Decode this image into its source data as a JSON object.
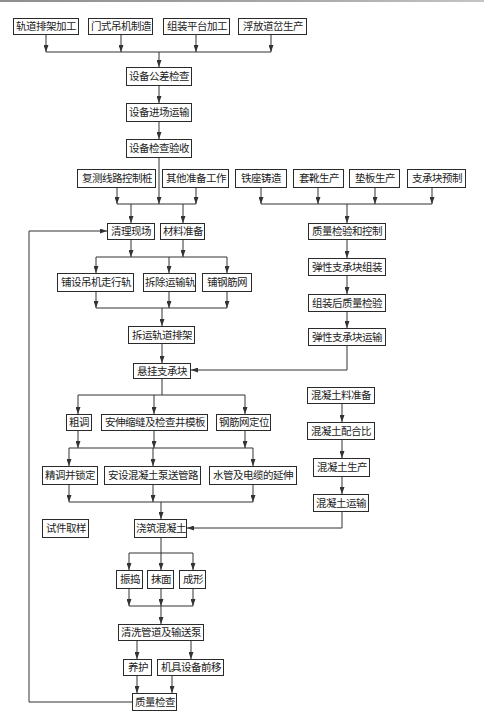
{
  "diagram": {
    "type": "flowchart",
    "nodes": [
      {
        "id": "n0",
        "label": "轨道排架加工"
      },
      {
        "id": "n1",
        "label": "门式吊机制造"
      },
      {
        "id": "n2",
        "label": "组装平台加工"
      },
      {
        "id": "n3",
        "label": "浮放道岔生产"
      },
      {
        "id": "n4",
        "label": "设备公差检查"
      },
      {
        "id": "n5",
        "label": "设备进场运输"
      },
      {
        "id": "n6",
        "label": "设备检查验收"
      },
      {
        "id": "n7",
        "label": "复测线路控制桩"
      },
      {
        "id": "n8",
        "label": "其他准备工作"
      },
      {
        "id": "n9",
        "label": "铁座铸造"
      },
      {
        "id": "n10",
        "label": "套靴生产"
      },
      {
        "id": "n11",
        "label": "垫板生产"
      },
      {
        "id": "n12",
        "label": "支承块预制"
      },
      {
        "id": "n13",
        "label": "清理现场"
      },
      {
        "id": "n14",
        "label": "材料准备"
      },
      {
        "id": "n15",
        "label": "质量检验和控制"
      },
      {
        "id": "n16",
        "label": "铺设吊机走行轨"
      },
      {
        "id": "n17",
        "label": "拆除运输轨"
      },
      {
        "id": "n18",
        "label": "铺钢筋网"
      },
      {
        "id": "n19",
        "label": "弹性支承块组装"
      },
      {
        "id": "n20",
        "label": "组装后质量检验"
      },
      {
        "id": "n21",
        "label": "弹性支承块运输"
      },
      {
        "id": "n22",
        "label": "拆运轨道排架"
      },
      {
        "id": "n23",
        "label": "悬挂支承块"
      },
      {
        "id": "n24",
        "label": "混凝土料准备"
      },
      {
        "id": "n25",
        "label": "粗调"
      },
      {
        "id": "n26",
        "label": "安伸缩缝及检查井模板"
      },
      {
        "id": "n27",
        "label": "钢筋网定位"
      },
      {
        "id": "n28",
        "label": "混凝土配合比"
      },
      {
        "id": "n29",
        "label": "混凝土生产"
      },
      {
        "id": "n30",
        "label": "精调并锁定"
      },
      {
        "id": "n31",
        "label": "安设混凝土泵送管路"
      },
      {
        "id": "n32",
        "label": "水管及电缆的延伸"
      },
      {
        "id": "n33",
        "label": "混凝土运输"
      },
      {
        "id": "n34",
        "label": "试件取样"
      },
      {
        "id": "n35",
        "label": "浇筑混凝土"
      },
      {
        "id": "n36",
        "label": "振捣"
      },
      {
        "id": "n37",
        "label": "抹面"
      },
      {
        "id": "n38",
        "label": "成形"
      },
      {
        "id": "n39",
        "label": "清洗管道及输送泵"
      },
      {
        "id": "n40",
        "label": "养护"
      },
      {
        "id": "n41",
        "label": "机具设备前移"
      },
      {
        "id": "n42",
        "label": "质量检查"
      }
    ],
    "edges": [
      {
        "from": [
          "n0",
          "n1",
          "n2",
          "n3"
        ],
        "to": [
          "n4"
        ]
      },
      {
        "from": [
          "n4"
        ],
        "to": [
          "n5"
        ]
      },
      {
        "from": [
          "n5"
        ],
        "to": [
          "n6"
        ]
      },
      {
        "from": [
          "n6",
          "n7",
          "n8"
        ],
        "to": [
          "n13",
          "n14"
        ]
      },
      {
        "from": [
          "n9",
          "n10",
          "n11",
          "n12"
        ],
        "to": [
          "n15"
        ]
      },
      {
        "from": [
          "n15"
        ],
        "to": [
          "n19"
        ]
      },
      {
        "from": [
          "n19"
        ],
        "to": [
          "n20"
        ]
      },
      {
        "from": [
          "n20"
        ],
        "to": [
          "n21"
        ]
      },
      {
        "from": [
          "n21"
        ],
        "to": [
          "n23"
        ]
      },
      {
        "from": [
          "n13",
          "n14"
        ],
        "to": [
          "n16",
          "n17",
          "n18"
        ]
      },
      {
        "from": [
          "n16",
          "n17",
          "n18"
        ],
        "to": [
          "n22"
        ]
      },
      {
        "from": [
          "n22"
        ],
        "to": [
          "n23"
        ]
      },
      {
        "from": [
          "n23"
        ],
        "to": [
          "n25",
          "n26",
          "n27"
        ]
      },
      {
        "from": [
          "n25",
          "n26",
          "n27"
        ],
        "to": [
          "n30",
          "n31",
          "n32"
        ]
      },
      {
        "from": [
          "n30",
          "n31",
          "n32"
        ],
        "to": [
          "n35"
        ]
      },
      {
        "from": [
          "n24"
        ],
        "to": [
          "n28"
        ]
      },
      {
        "from": [
          "n28"
        ],
        "to": [
          "n29"
        ]
      },
      {
        "from": [
          "n29"
        ],
        "to": [
          "n33"
        ]
      },
      {
        "from": [
          "n33"
        ],
        "to": [
          "n35"
        ]
      },
      {
        "from": [
          "n35"
        ],
        "to": [
          "n36",
          "n37",
          "n38"
        ]
      },
      {
        "from": [
          "n36",
          "n37",
          "n38"
        ],
        "to": [
          "n39"
        ]
      },
      {
        "from": [
          "n39"
        ],
        "to": [
          "n40",
          "n41"
        ]
      },
      {
        "from": [
          "n40",
          "n41"
        ],
        "to": [
          "n42"
        ]
      },
      {
        "from": [
          "n42"
        ],
        "to": [
          "n13"
        ],
        "kind": "feedback-loop"
      }
    ],
    "isolated_nodes": [
      "n34"
    ]
  }
}
